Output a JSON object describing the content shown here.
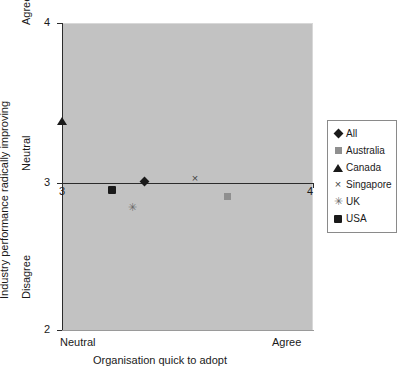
{
  "chart_data": {
    "type": "scatter",
    "title": "",
    "xlabel": "Organisation quick to adopt",
    "ylabel": "Industry performance radically improving",
    "xlim": [
      3,
      4
    ],
    "ylim": [
      2,
      4
    ],
    "grid": false,
    "legend_position": "right",
    "x_ticks": [
      "3",
      "4"
    ],
    "y_ticks": [
      "4",
      "3",
      "2"
    ],
    "x_anchors": {
      "low": "Neutral",
      "high": "Agree"
    },
    "y_anchors": {
      "low": "Disagree",
      "mid": "Neutral",
      "high": "Agree"
    },
    "series": [
      {
        "name": "All",
        "marker": "diamond",
        "x": 3.33,
        "y": 2.97
      },
      {
        "name": "Australia",
        "marker": "square-gray",
        "x": 3.66,
        "y": 2.87
      },
      {
        "name": "Canada",
        "marker": "triangle",
        "x": 3.0,
        "y": 3.36
      },
      {
        "name": "Singapore",
        "marker": "cross",
        "x": 3.53,
        "y": 2.99
      },
      {
        "name": "UK",
        "marker": "star",
        "x": 3.28,
        "y": 2.8
      },
      {
        "name": "USA",
        "marker": "square-black",
        "x": 3.2,
        "y": 2.91
      }
    ]
  },
  "legend": {
    "items": [
      {
        "label": "All",
        "glyph": "◆",
        "marker_name": "diamond-marker"
      },
      {
        "label": "Australia",
        "glyph": "■",
        "marker_name": "gray-square-marker"
      },
      {
        "label": "Canada",
        "glyph": "▲",
        "marker_name": "triangle-marker"
      },
      {
        "label": "Singapore",
        "glyph": "×",
        "marker_name": "cross-marker"
      },
      {
        "label": "UK",
        "glyph": "✳",
        "marker_name": "star-marker"
      },
      {
        "label": "USA",
        "glyph": "■",
        "marker_name": "black-square-marker"
      }
    ]
  },
  "axes": {
    "y_title": "Industry performance radically improving",
    "x_title": "Organisation quick to adopt",
    "y_tick_4": "4",
    "y_tick_3": "3",
    "y_tick_2": "2",
    "x_tick_3": "3",
    "x_tick_4": "4",
    "y_anchor_agree": "Agree",
    "y_anchor_neutral": "Neutral",
    "y_anchor_disagree": "Disagree",
    "x_anchor_neutral": "Neutral",
    "x_anchor_agree": "Agree"
  },
  "colors": {
    "plot_background": "#c2c2c2",
    "axis": "#2b2b2b",
    "marker_dark": "#1a1a1a",
    "marker_gray": "#8f8f8f",
    "page_background": "#ffffff"
  }
}
